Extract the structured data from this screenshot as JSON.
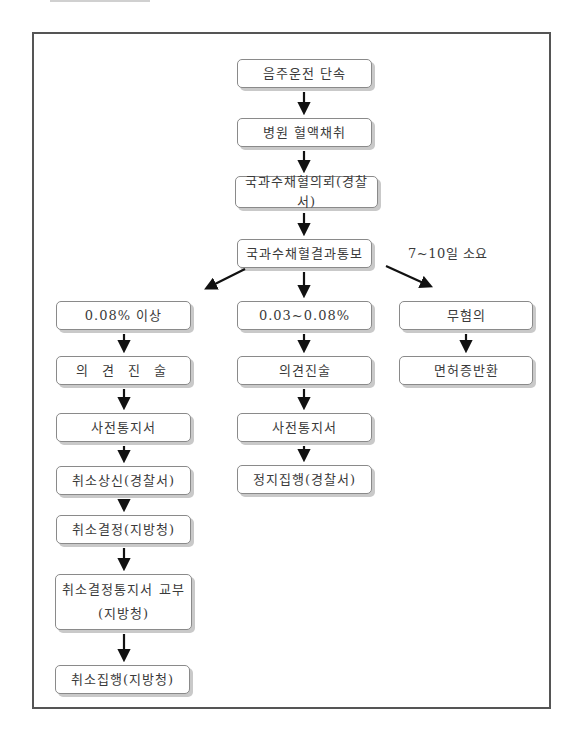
{
  "diagram": {
    "type": "flowchart",
    "note": "7~10일 소요",
    "nodes": {
      "start": "음주운전 단속",
      "blood_sample": "병원 혈액채취",
      "nfs_request": "국과수채혈의뢰(경찰서)",
      "nfs_result": "국과수채혈결과통보",
      "left": {
        "condition": "0.08% 이상",
        "opinion": "의 견 진 술",
        "notice": "사전통지서",
        "cancel_report": "취소상신(경찰서)",
        "cancel_decision": "취소결정(지방청)",
        "cancel_notice": "취소결정통지서 교부\n(지방청)",
        "cancel_exec": "취소집행(지방청)"
      },
      "middle": {
        "condition": "0.03~0.08%",
        "opinion": "의견진술",
        "notice": "사전통지서",
        "suspend_exec": "정지집행(경찰서)"
      },
      "right": {
        "condition": "무혐의",
        "license_return": "면허증반환"
      }
    },
    "colors": {
      "frame": "#555555",
      "node_border": "#8a8a8a",
      "node_shadow": "#c9c9c9",
      "arrow": "#111111",
      "text": "#3a3a3a"
    }
  }
}
